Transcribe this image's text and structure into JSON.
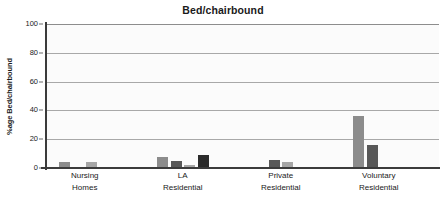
{
  "chart_data": {
    "type": "bar",
    "title": "Bed/chairbound",
    "xlabel": "",
    "ylabel": "%age Bed/chairbound",
    "ylim": [
      0,
      100
    ],
    "yticks": [
      0,
      20,
      40,
      60,
      80,
      100
    ],
    "grid": true,
    "legend": "none",
    "categories": [
      "Nursing Homes",
      "LA Residential",
      "Private Residential",
      "Voluntary Residential"
    ],
    "category_lines": [
      [
        "Nursing",
        "Homes"
      ],
      [
        "LA",
        "Residential"
      ],
      [
        "Private",
        "Residential"
      ],
      [
        "Voluntary",
        "Residential"
      ]
    ],
    "series": [
      {
        "name": "Series 1",
        "color": "#8c8c8c",
        "values": [
          4,
          7.5,
          1,
          36
        ]
      },
      {
        "name": "Series 2",
        "color": "#585858",
        "values": [
          1,
          5,
          5.5,
          16
        ]
      },
      {
        "name": "Series 3",
        "color": "#a6a6a6",
        "values": [
          4.5,
          2,
          4.5,
          0
        ]
      },
      {
        "name": "Series 4",
        "color": "#2b2b2b",
        "values": [
          0,
          9,
          1,
          0
        ]
      }
    ]
  },
  "axis": {
    "tick_labels": [
      "100",
      "80",
      "60",
      "40",
      "20",
      "0"
    ]
  }
}
